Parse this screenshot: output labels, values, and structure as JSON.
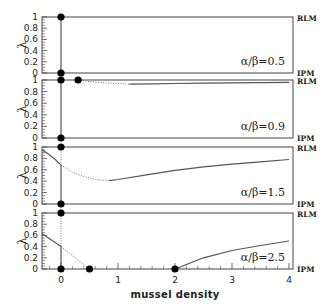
{
  "chart_data": {
    "type": "line",
    "title": "",
    "xlabel": "mussel density",
    "ylabel": "λ",
    "xlim": [
      -0.33,
      4.05
    ],
    "ylim": [
      0,
      1
    ],
    "x_ticks": [
      0,
      1,
      2,
      3,
      4
    ],
    "y_ticks": [
      0,
      0.2,
      0.4,
      0.6,
      0.8,
      1
    ],
    "right_labels": {
      "top": "RLM",
      "bottom": "IPM"
    },
    "grid": false,
    "panels": [
      {
        "label": "α/β=0.5",
        "ratio": 0.5,
        "points": [
          {
            "x": 0,
            "y": 1
          },
          {
            "x": 0,
            "y": 0
          }
        ],
        "solid_segments": [
          {
            "x": [
              0,
              0
            ],
            "y": [
              0,
              1
            ]
          }
        ],
        "dotted_segments": []
      },
      {
        "label": "α/β=0.9",
        "ratio": 0.9,
        "points": [
          {
            "x": 0,
            "y": 1
          },
          {
            "x": 0.3,
            "y": 1
          },
          {
            "x": 0,
            "y": 0
          }
        ],
        "solid_segments": [
          {
            "x": [
              0,
              0
            ],
            "y": [
              0,
              1
            ]
          },
          {
            "x": [
              1.2,
              1.6,
              2.0,
              2.5,
              3.0,
              3.5,
              4.0
            ],
            "y": [
              0.93,
              0.935,
              0.94,
              0.945,
              0.95,
              0.955,
              0.96
            ]
          }
        ],
        "dotted_segments": [
          {
            "x": [
              0.3,
              0.5,
              0.8,
              1.0,
              1.2
            ],
            "y": [
              1.0,
              0.97,
              0.95,
              0.94,
              0.93
            ]
          }
        ]
      },
      {
        "label": "α/β=1.5",
        "ratio": 1.5,
        "points": [
          {
            "x": 0,
            "y": 1
          },
          {
            "x": 0,
            "y": 0
          }
        ],
        "solid_segments": [
          {
            "x": [
              -0.33,
              -0.2,
              -0.1,
              0
            ],
            "y": [
              0.95,
              0.86,
              0.78,
              0.68
            ]
          },
          {
            "x": [
              0,
              0
            ],
            "y": [
              0,
              0.68
            ]
          },
          {
            "x": [
              0.85,
              1.0,
              1.5,
              2.0,
              2.5,
              3.0,
              3.5,
              4.0
            ],
            "y": [
              0.41,
              0.43,
              0.51,
              0.59,
              0.65,
              0.7,
              0.74,
              0.78
            ]
          }
        ],
        "dotted_segments": [
          {
            "x": [
              0,
              0
            ],
            "y": [
              0.68,
              1
            ]
          },
          {
            "x": [
              0,
              0.2,
              0.4,
              0.6,
              0.85
            ],
            "y": [
              0.68,
              0.56,
              0.48,
              0.43,
              0.41
            ]
          }
        ]
      },
      {
        "label": "α/β=2.5",
        "ratio": 2.5,
        "points": [
          {
            "x": 0,
            "y": 1
          },
          {
            "x": 0,
            "y": 0
          },
          {
            "x": 0.5,
            "y": 0
          },
          {
            "x": 2,
            "y": 0
          }
        ],
        "solid_segments": [
          {
            "x": [
              -0.33,
              0
            ],
            "y": [
              0.63,
              0.4
            ]
          },
          {
            "x": [
              0,
              0
            ],
            "y": [
              0,
              0.4
            ]
          },
          {
            "x": [
              2.0,
              2.5,
              3.0,
              3.5,
              4.0
            ],
            "y": [
              0.0,
              0.2,
              0.33,
              0.42,
              0.5
            ]
          }
        ],
        "dotted_segments": [
          {
            "x": [
              0,
              0
            ],
            "y": [
              0.4,
              1
            ]
          },
          {
            "x": [
              0,
              0.5
            ],
            "y": [
              0.4,
              0.0
            ]
          }
        ]
      }
    ]
  }
}
